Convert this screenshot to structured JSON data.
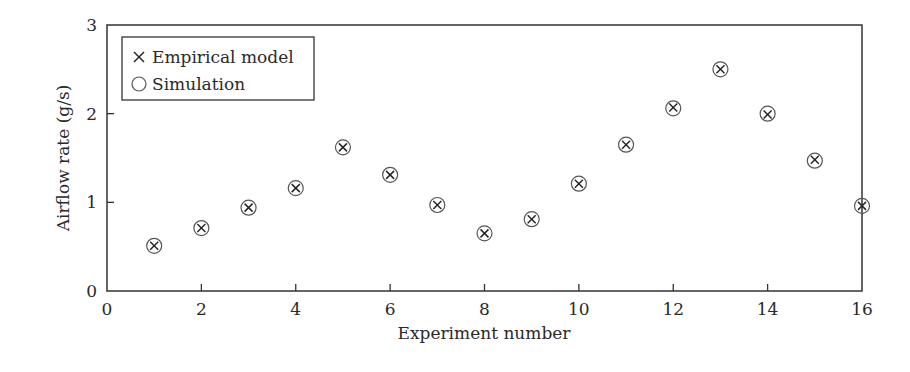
{
  "chart_data": {
    "type": "scatter",
    "title": "",
    "xlabel": "Experiment number",
    "ylabel": "Airflow rate (g/s)",
    "xlim": [
      0,
      16
    ],
    "ylim": [
      0,
      3
    ],
    "xticks": [
      0,
      2,
      4,
      6,
      8,
      10,
      12,
      14,
      16
    ],
    "yticks": [
      0,
      1,
      2,
      3
    ],
    "grid": false,
    "legend_position": "upper-left",
    "x": [
      1,
      2,
      3,
      4,
      5,
      6,
      7,
      8,
      9,
      10,
      11,
      12,
      13,
      14,
      15,
      16
    ],
    "series": [
      {
        "name": "Empirical model",
        "marker": "x",
        "values": [
          0.51,
          0.71,
          0.94,
          1.16,
          1.62,
          1.31,
          0.97,
          0.65,
          0.81,
          1.21,
          1.65,
          2.07,
          2.5,
          1.99,
          1.48,
          0.96
        ]
      },
      {
        "name": "Simulation",
        "marker": "o",
        "values": [
          0.51,
          0.71,
          0.94,
          1.16,
          1.62,
          1.31,
          0.97,
          0.65,
          0.81,
          1.21,
          1.65,
          2.06,
          2.5,
          2.0,
          1.47,
          0.96
        ]
      }
    ]
  },
  "legend": {
    "items": [
      {
        "symbol": "×",
        "label": "Empirical model"
      },
      {
        "symbol": "○",
        "label": "Simulation"
      }
    ]
  },
  "colors": {
    "axis": "#333333",
    "marker_x": "#222222",
    "marker_o": "#555555"
  }
}
